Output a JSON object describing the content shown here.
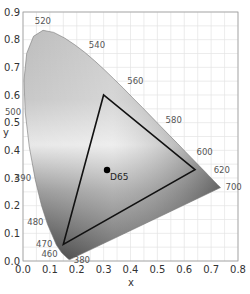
{
  "chart_data": {
    "type": "scatter",
    "xlabel": "x",
    "ylabel": "y",
    "xlim": [
      0.0,
      0.8
    ],
    "ylim": [
      0.0,
      0.9
    ],
    "grid": true,
    "xticks": [
      "0.0",
      "0.1",
      "0.2",
      "0.3",
      "0.4",
      "0.5",
      "0.6",
      "0.7",
      "0.8"
    ],
    "yticks": [
      "0.0",
      "0.1",
      "0.2",
      "0.3",
      "0.4",
      "0.5",
      "0.6",
      "0.7",
      "0.8",
      "0.9"
    ],
    "spectral_locus_labels": [
      {
        "nm": "380",
        "x": 0.174,
        "y": 0.005
      },
      {
        "nm": "460",
        "x": 0.144,
        "y": 0.03
      },
      {
        "nm": "470",
        "x": 0.124,
        "y": 0.058
      },
      {
        "nm": "480",
        "x": 0.091,
        "y": 0.133
      },
      {
        "nm": "490",
        "x": 0.045,
        "y": 0.295
      },
      {
        "nm": "500",
        "x": 0.008,
        "y": 0.538
      },
      {
        "nm": "520",
        "x": 0.074,
        "y": 0.834
      },
      {
        "nm": "540",
        "x": 0.23,
        "y": 0.754
      },
      {
        "nm": "560",
        "x": 0.373,
        "y": 0.624
      },
      {
        "nm": "580",
        "x": 0.512,
        "y": 0.487
      },
      {
        "nm": "600",
        "x": 0.627,
        "y": 0.372
      },
      {
        "nm": "620",
        "x": 0.691,
        "y": 0.308
      },
      {
        "nm": "700",
        "x": 0.735,
        "y": 0.265
      }
    ],
    "gamut_triangle": {
      "name": "sRGB",
      "vertices": [
        {
          "label": "R",
          "x": 0.64,
          "y": 0.33
        },
        {
          "label": "G",
          "x": 0.3,
          "y": 0.6
        },
        {
          "label": "B",
          "x": 0.15,
          "y": 0.06
        }
      ]
    },
    "white_point": {
      "label": "D65",
      "x": 0.3127,
      "y": 0.329
    }
  },
  "labels": {
    "x_axis": "x",
    "y_axis": "y",
    "white_point": "D65"
  }
}
